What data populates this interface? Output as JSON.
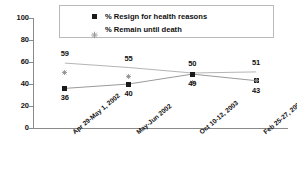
{
  "chart_data": {
    "type": "line",
    "title": "",
    "subtitle": "",
    "xlabel": "",
    "ylabel": "",
    "ylim": [
      0,
      100
    ],
    "yticks": [
      0,
      20,
      40,
      60,
      80,
      100
    ],
    "grid": false,
    "legend_position": "top-center",
    "categories": [
      "Apr 29-May 1, 2002",
      "May-Jun 2002",
      "Oct 10-12, 2003",
      "Feb 25-27, 2005"
    ],
    "series": [
      {
        "name": "% Resign for health reasons",
        "marker": "square",
        "color": "#1a1a1a",
        "label_position": "below",
        "values": [
          36,
          40,
          49,
          43
        ]
      },
      {
        "name": "% Remain until death",
        "marker": "diamond",
        "color": "#8c8c8c",
        "label_position": "above",
        "values": [
          59,
          55,
          50,
          51
        ]
      }
    ]
  },
  "legend": {
    "entries": [
      {
        "label": "% Resign for health reasons",
        "marker": "square-marker-icon"
      },
      {
        "label": "% Remain until death",
        "marker": "diamond-marker-icon"
      }
    ]
  },
  "axis": {
    "y": {
      "ticks": [
        "100",
        "80",
        "60",
        "40",
        "20",
        "0"
      ]
    },
    "x": {
      "ticks": [
        "Apr 29-May 1, 2002",
        "May-Jun 2002",
        "Oct 10-12, 2003",
        "Feb 25-27, 2005"
      ]
    }
  }
}
